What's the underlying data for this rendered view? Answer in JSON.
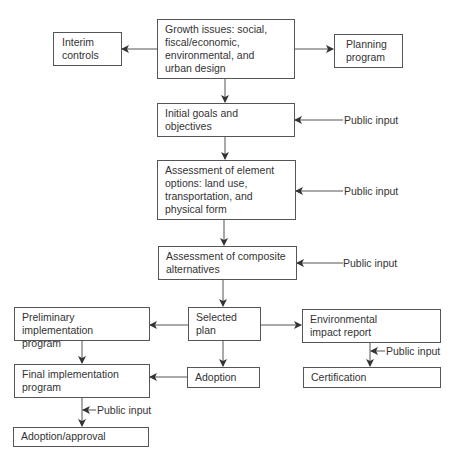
{
  "diagram": {
    "type": "flowchart",
    "nodes": {
      "growth": "Growth issues: social,\nfiscal/economic,\nenvironmental, and\nurban design",
      "interim": "Interim\ncontrols",
      "planning": "Planning\nprogram",
      "initial": "Initial goals and\nobjectives",
      "element": "Assessment of element\noptions: land use,\ntransportation, and\nphysical form",
      "composite": "Assessment of composite\nalternatives",
      "selected": "Selected\nplan",
      "prelim": "Preliminary implementation\nprogram",
      "eir": "Environmental\nimpact report",
      "adoption": "Adoption",
      "certification": "Certification",
      "final": "Final implementation\nprogram",
      "approval": "Adoption/approval"
    },
    "public_input_label": "Public input",
    "edges": [
      [
        "growth",
        "interim"
      ],
      [
        "growth",
        "planning"
      ],
      [
        "growth",
        "initial"
      ],
      [
        "initial",
        "element"
      ],
      [
        "element",
        "composite"
      ],
      [
        "composite",
        "selected"
      ],
      [
        "selected",
        "prelim"
      ],
      [
        "selected",
        "eir"
      ],
      [
        "selected",
        "adoption"
      ],
      [
        "prelim",
        "final"
      ],
      [
        "adoption",
        "final"
      ],
      [
        "eir",
        "certification"
      ],
      [
        "final",
        "approval"
      ]
    ],
    "public_inputs_to": [
      "initial",
      "element",
      "composite",
      "eir-certification",
      "final-approval"
    ]
  }
}
